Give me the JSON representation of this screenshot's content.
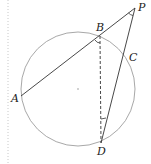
{
  "diagram": {
    "colors": {
      "circle": "#a8a8a8",
      "lines": "#333333",
      "margin_rule": "#c8c8c8"
    },
    "circle": {
      "cx": 78,
      "cy": 89,
      "r": 57
    },
    "points": {
      "P": {
        "label": "P",
        "x": 135,
        "y": 8
      },
      "B": {
        "label": "B",
        "x": 100,
        "y": 36
      },
      "A": {
        "label": "A",
        "x": 21,
        "y": 96
      },
      "C": {
        "label": "C",
        "x": 126,
        "y": 57
      },
      "D": {
        "label": "D",
        "x": 101,
        "y": 143
      }
    },
    "segments": [
      {
        "from": "P",
        "to": "A",
        "style": "solid"
      },
      {
        "from": "P",
        "to": "D",
        "style": "solid"
      },
      {
        "from": "B",
        "to": "D",
        "style": "dashed"
      }
    ],
    "angle_marks": [
      "angle-P",
      "angle-B",
      "angle-D"
    ]
  }
}
